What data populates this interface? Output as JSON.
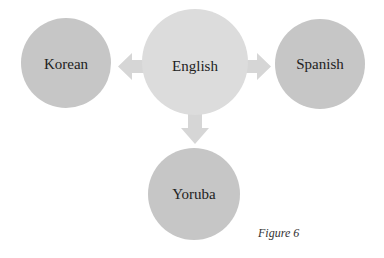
{
  "diagram": {
    "center": {
      "label": "English",
      "color": "#dcdcdc"
    },
    "nodes": [
      {
        "id": "korean",
        "label": "Korean",
        "color": "#c6c6c6"
      },
      {
        "id": "spanish",
        "label": "Spanish",
        "color": "#c6c6c6"
      },
      {
        "id": "yoruba",
        "label": "Yoruba",
        "color": "#c6c6c6"
      }
    ],
    "edges": [
      {
        "from": "English",
        "to": "Korean"
      },
      {
        "from": "English",
        "to": "Spanish"
      },
      {
        "from": "English",
        "to": "Yoruba"
      }
    ],
    "arrow_color": "#d6d6d6"
  },
  "caption": "Figure 6"
}
